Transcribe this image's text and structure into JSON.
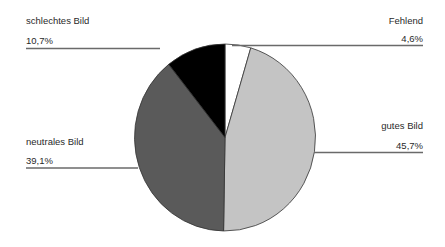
{
  "chart_data": {
    "type": "pie",
    "title": "",
    "start_angle": "12 o'clock",
    "direction": "clockwise",
    "slices": [
      {
        "label": "Fehlend",
        "value": 4.6,
        "display": "4,6%",
        "color": "#ffffff"
      },
      {
        "label": "gutes Bild",
        "value": 45.7,
        "display": "45,7%",
        "color": "#c4c4c4"
      },
      {
        "label": "neutrales Bild",
        "value": 39.1,
        "display": "39,1%",
        "color": "#5a5a5a"
      },
      {
        "label": "schlechtes Bild",
        "value": 10.7,
        "display": "10,7%",
        "color": "#000000"
      }
    ],
    "legend": "none (leader-line labels)"
  },
  "labels": {
    "fehlend": {
      "name": "Fehlend",
      "value": "4,6%"
    },
    "gutes": {
      "name": "gutes Bild",
      "value": "45,7%"
    },
    "neutrales": {
      "name": "neutrales Bild",
      "value": "39,1%"
    },
    "schlechtes": {
      "name": "schlechtes Bild",
      "value": "10,7%"
    }
  }
}
